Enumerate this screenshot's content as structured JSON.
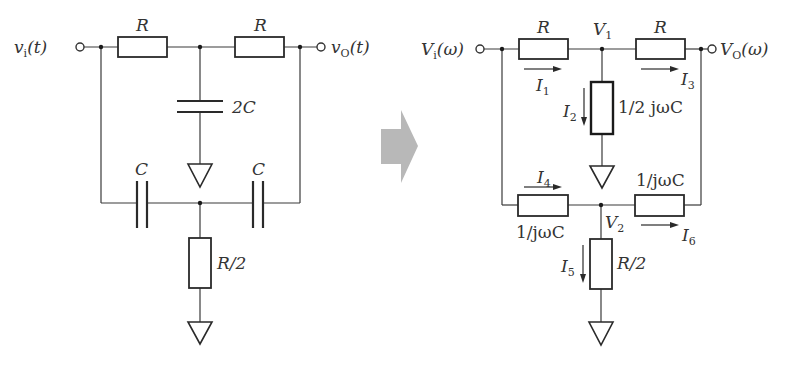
{
  "left_circuit": {
    "input_label": {
      "var": "v",
      "sub": "i",
      "arg": "(t)"
    },
    "output_label": {
      "var": "v",
      "sub": "O",
      "arg": "(t)"
    },
    "resistor_top_left": "R",
    "resistor_top_right": "R",
    "capacitor_middle": "2C",
    "capacitor_bottom_left": "C",
    "capacitor_bottom_right": "C",
    "resistor_bottom": "R/2"
  },
  "transform_arrow": {
    "color": "#b8b8b8"
  },
  "right_circuit": {
    "input_label": {
      "var": "V",
      "sub": "i",
      "arg": "(ω)"
    },
    "output_label": {
      "var": "V",
      "sub": "O",
      "arg": "(ω)"
    },
    "node_v1": {
      "var": "V",
      "sub": "1"
    },
    "node_v2": {
      "var": "V",
      "sub": "2"
    },
    "resistor_top_left": "R",
    "resistor_top_right": "R",
    "impedance_middle": "1/2 jωC",
    "impedance_bottom_left": "1/jωC",
    "impedance_bottom_right": "1/jωC",
    "resistor_bottom": "R/2",
    "currents": [
      {
        "var": "I",
        "sub": "1"
      },
      {
        "var": "I",
        "sub": "2"
      },
      {
        "var": "I",
        "sub": "3"
      },
      {
        "var": "I",
        "sub": "4"
      },
      {
        "var": "I",
        "sub": "5"
      },
      {
        "var": "I",
        "sub": "6"
      }
    ]
  }
}
